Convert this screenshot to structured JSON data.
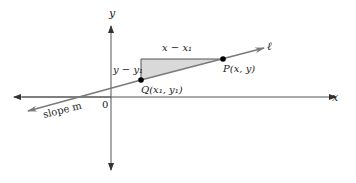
{
  "figure": {
    "x_axis_label": "x",
    "y_axis_label": "y",
    "origin_label": "0",
    "line_label": "ℓ",
    "slope_label": "slope m",
    "point_p_label": "P(x, y)",
    "point_q_label": "Q(x₁, y₁)",
    "run_label": "x − x₁",
    "rise_label": "y − y₁"
  },
  "colors": {
    "axis": "#555555",
    "line": "#7a7a7a",
    "triangle_fill": "#d9d9d9",
    "triangle_stroke": "#555555",
    "point": "#000000",
    "text": "#222222"
  }
}
